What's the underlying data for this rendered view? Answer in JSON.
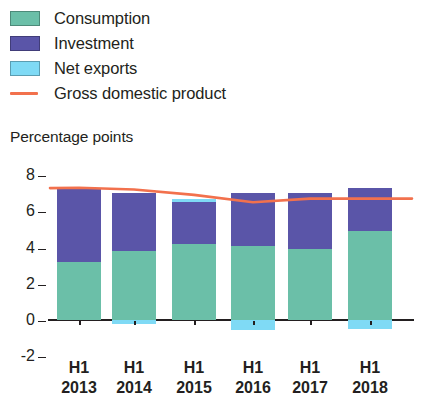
{
  "legend": {
    "items": [
      {
        "label": "Consumption",
        "color": "#6BBFA8",
        "marker": "swatch",
        "name": "legend-swatch-consumption"
      },
      {
        "label": "Investment",
        "color": "#5A55A8",
        "marker": "swatch",
        "name": "legend-swatch-investment"
      },
      {
        "label": "Net exports",
        "color": "#7FDAF5",
        "marker": "swatch",
        "name": "legend-swatch-net-exports"
      },
      {
        "label": "Gross domestic product",
        "color": "#F2714D",
        "marker": "line",
        "name": "legend-line-gdp"
      }
    ]
  },
  "axis": {
    "ylabel": "Percentage points",
    "yticks": [
      "8",
      "6",
      "4",
      "2",
      "0",
      "-2"
    ],
    "xticks_line1": [
      "H1",
      "H1",
      "H1",
      "H1",
      "H1",
      "H1"
    ],
    "xticks_line2": [
      "2013",
      "2014",
      "2015",
      "2016",
      "2017",
      "2018"
    ]
  },
  "chart_data": {
    "type": "bar",
    "title": "",
    "subtitle": "",
    "xlabel": "",
    "ylabel": "Percentage points",
    "ylim": [
      -2,
      8
    ],
    "ytick_values": [
      8,
      6,
      4,
      2,
      0,
      -2
    ],
    "grid": false,
    "stacked": true,
    "legend_position": "top-left",
    "categories": [
      "H1 2013",
      "H1 2014",
      "H1 2015",
      "H1 2016",
      "H1 2017",
      "H1 2018"
    ],
    "series": [
      {
        "name": "Consumption",
        "color": "#6BBFA8",
        "values": [
          3.2,
          3.8,
          4.2,
          4.1,
          3.9,
          4.9
        ]
      },
      {
        "name": "Investment",
        "color": "#5A55A8",
        "values": [
          4.1,
          3.2,
          2.3,
          2.9,
          3.1,
          2.4
        ]
      },
      {
        "name": "Net exports",
        "color": "#7FDAF5",
        "values": [
          0.0,
          -0.2,
          0.2,
          -0.55,
          0.0,
          -0.5
        ]
      }
    ],
    "overlay_line": {
      "name": "Gross domestic product",
      "color": "#F2714D",
      "type": "line",
      "values": [
        7.3,
        7.2,
        6.9,
        6.5,
        6.7,
        6.7
      ]
    }
  },
  "colors": {
    "consumption": "#6BBFA8",
    "investment": "#5A55A8",
    "net_exports": "#7FDAF5",
    "gdp_line": "#F2714D",
    "axis": "#231f20"
  }
}
